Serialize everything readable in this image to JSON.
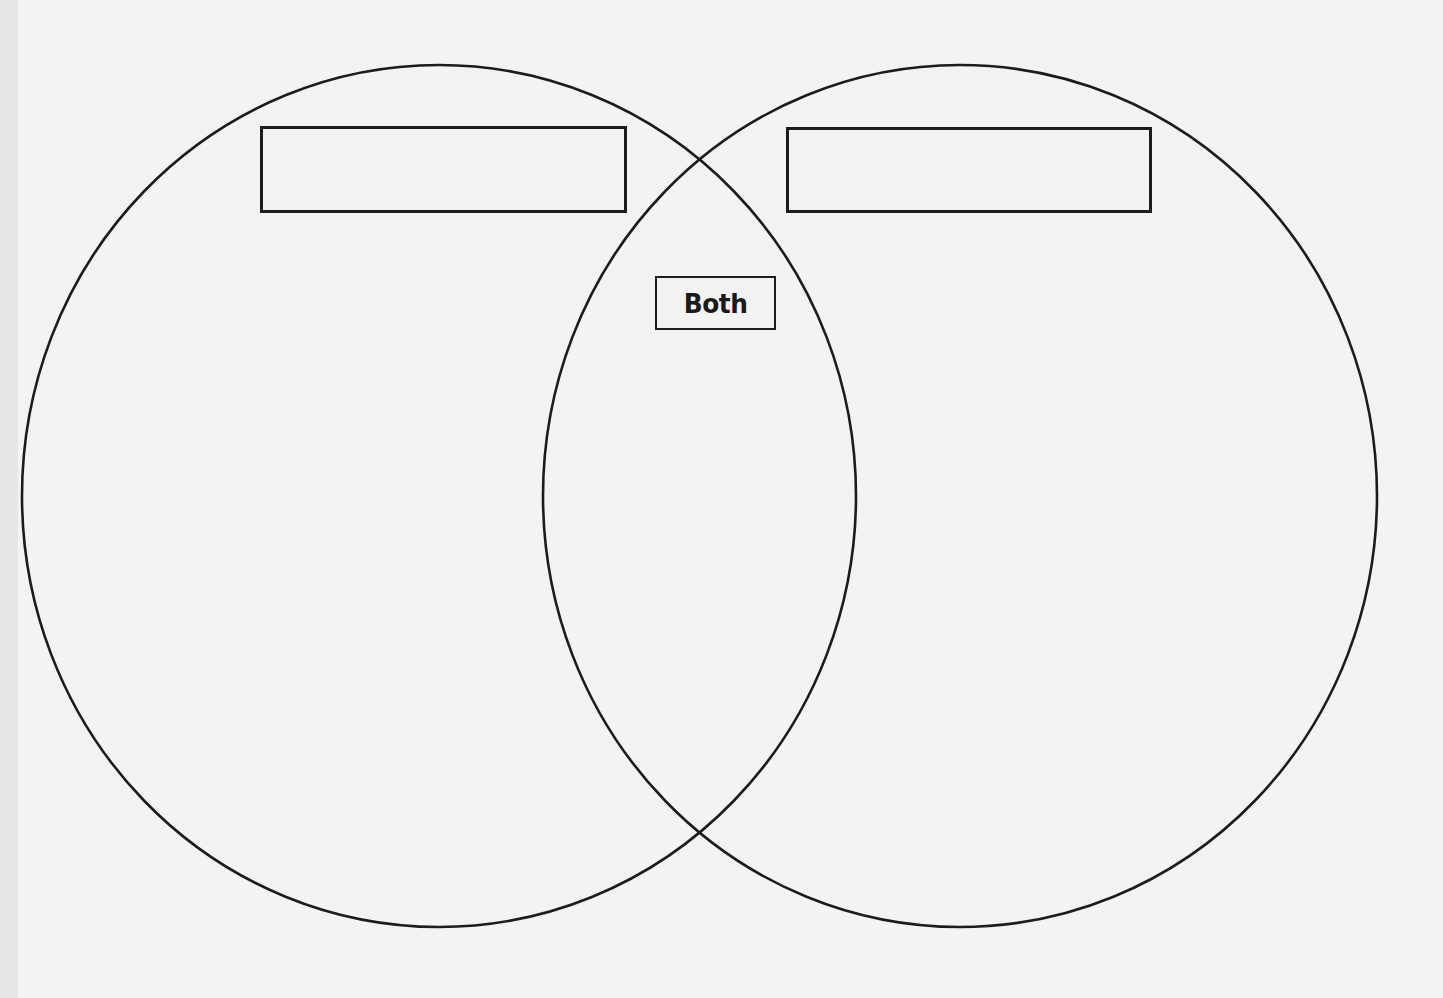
{
  "diagram": {
    "type": "venn",
    "sets": [
      {
        "id": "left",
        "label": "",
        "shape": "ellipse",
        "center": [
          439,
          496
        ],
        "radius_x": 417,
        "radius_y": 431
      },
      {
        "id": "right",
        "label": "",
        "shape": "ellipse",
        "center": [
          960,
          496
        ],
        "radius_x": 417,
        "radius_y": 431
      }
    ],
    "intersection": {
      "label": "Both"
    },
    "colors": {
      "stroke": "#1c1c1c",
      "background": "#f3f3f1"
    }
  }
}
